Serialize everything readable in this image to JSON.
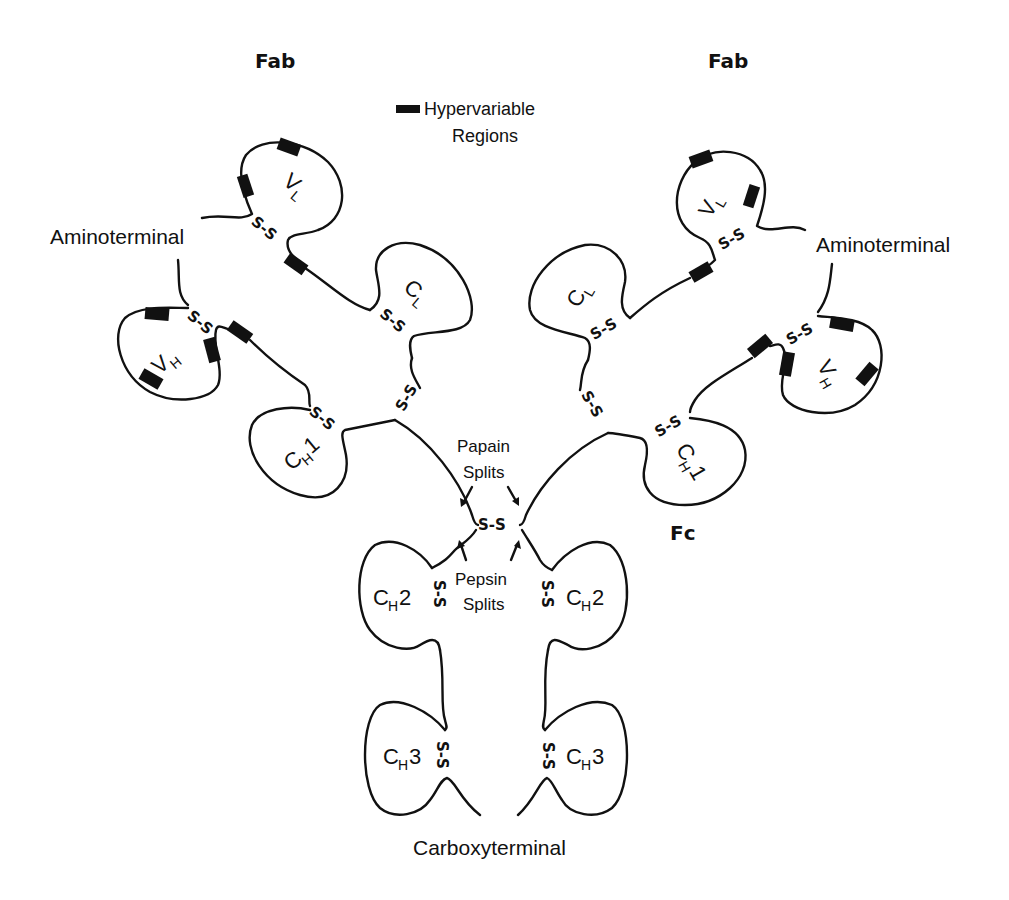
{
  "figure": {
    "type": "antibody (IgG) structure diagram",
    "background": "#ffffff",
    "ink_color": "#111111"
  },
  "labels": {
    "fab_left": "Fab",
    "fab_right": "Fab",
    "fc": "Fc",
    "legend_line1": "Hypervariable",
    "legend_line2": "Regions",
    "aminoterminal_left": "Aminoterminal",
    "aminoterminal_right": "Aminoterminal",
    "carboxyterminal": "Carboxyterminal",
    "papain_line1": "Papain",
    "papain_line2": "Splits",
    "pepsin_line1": "Pepsin",
    "pepsin_line2": "Splits",
    "disulfide": "S-S"
  },
  "domains": {
    "vl": {
      "main": "V",
      "sub": "L"
    },
    "cl": {
      "main": "C",
      "sub": "L"
    },
    "vh": {
      "main": "V",
      "sub": "H"
    },
    "ch1": {
      "main": "C",
      "sub": "H",
      "suffix": "1"
    },
    "ch2": {
      "main": "C",
      "sub": "H",
      "suffix": "2"
    },
    "ch3": {
      "main": "C",
      "sub": "H",
      "suffix": "3"
    }
  },
  "legend": {
    "swatch_color": "#111111",
    "meaning": "Hypervariable Regions"
  }
}
